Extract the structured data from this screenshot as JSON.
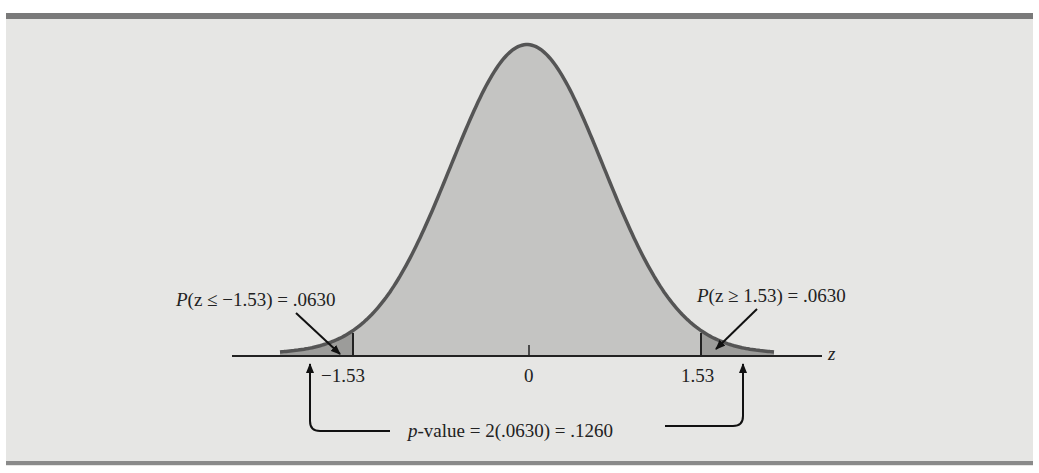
{
  "figure": {
    "axis_variable": "z",
    "ticks": [
      {
        "value": -1.53,
        "label": "−1.53"
      },
      {
        "value": 0,
        "label": "0"
      },
      {
        "value": 1.53,
        "label": "1.53"
      }
    ],
    "left_annotation": {
      "prefix": "P",
      "body": "(z ≤ −1.53) = .0630"
    },
    "right_annotation": {
      "prefix": "P",
      "body": "(z ≥ 1.53) = .0630"
    },
    "pvalue_annotation": {
      "prefix": "p",
      "body": "-value = 2(.0630) = .1260"
    }
  },
  "colors": {
    "background": "#e6e6e4",
    "curve_fill": "#c4c4c2",
    "tail_fill": "#9c9c9a",
    "curve_stroke": "#555555",
    "axis": "#222222"
  },
  "chart_data": {
    "type": "area",
    "title": "",
    "xlabel": "z",
    "ylabel": "",
    "distribution": "standard normal",
    "x_ticks": [
      -1.53,
      0,
      1.53
    ],
    "shaded_regions": [
      {
        "range": [
          "-inf",
          -1.53
        ],
        "probability": 0.063,
        "label": "P(z ≤ −1.53) = .0630"
      },
      {
        "range": [
          1.53,
          "inf"
        ],
        "probability": 0.063,
        "label": "P(z ≥ 1.53) = .0630"
      }
    ],
    "annotations": [
      "p-value = 2(.0630) = .1260"
    ],
    "p_value": 0.126,
    "grid": false
  }
}
